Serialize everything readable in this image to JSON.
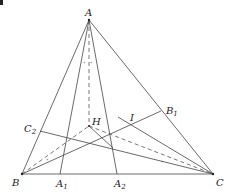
{
  "diagram": {
    "type": "geometry",
    "points": {
      "A": {
        "label": "A",
        "sub": "",
        "x": 89,
        "y": 20
      },
      "B": {
        "label": "B",
        "sub": "",
        "x": 22,
        "y": 174
      },
      "C": {
        "label": "C",
        "sub": "",
        "x": 213,
        "y": 174
      },
      "A1": {
        "label": "A",
        "sub": "1",
        "x": 60,
        "y": 174
      },
      "A2": {
        "label": "A",
        "sub": "2",
        "x": 117,
        "y": 174
      },
      "B1": {
        "label": "B",
        "sub": "1",
        "x": 161,
        "y": 111
      },
      "C2": {
        "label": "C",
        "sub": "2",
        "x": 40,
        "y": 131
      },
      "H": {
        "label": "H",
        "sub": "",
        "x": 89,
        "y": 126
      },
      "I": {
        "label": "I",
        "sub": "",
        "x": 131,
        "y": 124
      }
    },
    "solid_segments": [
      [
        "A",
        "B"
      ],
      [
        "A",
        "C"
      ],
      [
        "B",
        "C"
      ],
      [
        "A",
        "A1"
      ],
      [
        "A",
        "A2"
      ],
      [
        "B",
        "B1"
      ],
      [
        "C",
        "C2"
      ],
      [
        "H",
        "A2"
      ],
      [
        "I",
        "C"
      ]
    ],
    "dashed_segments": [
      [
        "A",
        "H"
      ],
      [
        "B",
        "H"
      ],
      [
        "H",
        "C"
      ]
    ],
    "angle_marks": [
      "∘",
      "∘",
      "∘",
      "∘"
    ],
    "colors": {
      "stroke": "#444444",
      "label": "#222222",
      "background": "#ffffff"
    }
  }
}
